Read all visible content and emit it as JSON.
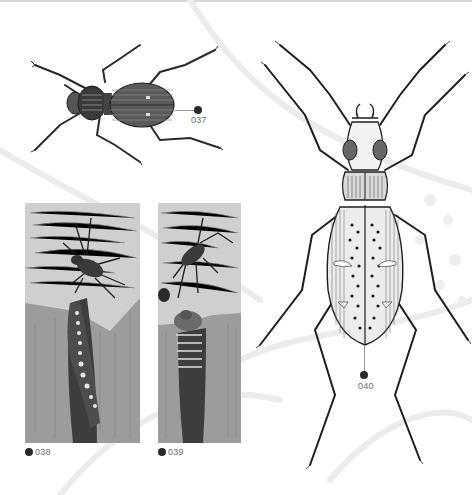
{
  "page": {
    "background": "#ffffff"
  },
  "figures": [
    {
      "id": "037",
      "label": "037",
      "subject": "beetle-dorsal-view-small"
    },
    {
      "id": "038",
      "label": "038",
      "subject": "beetle-attacking-larva-in-burrow"
    },
    {
      "id": "039",
      "label": "039",
      "subject": "beetle-and-larva-at-burrow-entrance"
    },
    {
      "id": "040",
      "label": "040",
      "subject": "large-spotted-ground-beetle"
    }
  ],
  "colors": {
    "ink": "#1e1e1e",
    "callout_dot": "#2a2a2a",
    "label_text": "#6e6e6e",
    "leader_line": "#9a9a9a",
    "panel_sky": "#cfcfcf",
    "panel_ground": "#9a9a9a",
    "watermark": "#ececec"
  }
}
